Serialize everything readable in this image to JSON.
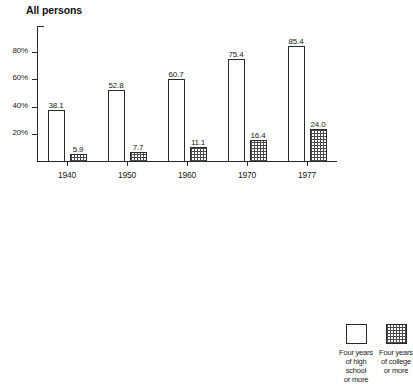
{
  "chart_data": [
    {
      "type": "bar",
      "title": "All persons",
      "xlabel": "",
      "ylabel": "",
      "ylim": [
        0,
        100
      ],
      "grid": false,
      "legend_position": "bottom-right",
      "categories": [
        "1940",
        "1950",
        "1960",
        "1970",
        "1977"
      ],
      "yticks": [
        "20%",
        "40%",
        "60%",
        "80%"
      ],
      "ytick_values": [
        20,
        40,
        60,
        80
      ],
      "series": [
        {
          "name": "Four years of high school or more",
          "style": "open",
          "values": [
            38.1,
            52.8,
            60.7,
            75.4,
            85.4
          ],
          "labels": [
            "38.1",
            "52.8",
            "60.7",
            "75.4",
            "85.4"
          ]
        },
        {
          "name": "Four years of college or more",
          "style": "hatched",
          "values": [
            5.9,
            7.7,
            11.1,
            16.4,
            24.0
          ],
          "labels": [
            "5.9",
            "7.7",
            "11.1",
            "16.4",
            "24.0"
          ]
        }
      ]
    },
    {
      "type": "bar",
      "title": "Black persons",
      "xlabel": "",
      "ylabel": "",
      "ylim": [
        0,
        100
      ],
      "grid": false,
      "legend_position": "bottom-right",
      "categories": [
        "1940",
        "1950",
        "1960",
        "1970",
        "1977"
      ],
      "yticks": [
        "20%",
        "40%",
        "60%",
        "80%"
      ],
      "ytick_values": [
        20,
        40,
        60,
        80
      ],
      "series": [
        {
          "name": "Four years of high school or more",
          "style": "open",
          "values": [
            11.6,
            22.2,
            37.7,
            56.2,
            74.4
          ],
          "labels": [
            "11.6",
            "22.2",
            "37.7",
            "56.2",
            "74.4"
          ]
        },
        {
          "name": "Four years of college or more",
          "style": "hatched",
          "values": [
            1.6,
            2.7,
            4.8,
            7.3,
            12.6
          ],
          "labels": [
            "1.6",
            "2.7",
            "4.8",
            "7.3",
            "12.6"
          ]
        }
      ]
    }
  ],
  "charts": {
    "all_persons": {
      "title": "All persons",
      "yticks": [
        "80%",
        "60%",
        "40%",
        "20%"
      ],
      "years": [
        "1940",
        "1950",
        "1960",
        "1970",
        "1977"
      ],
      "hs_labels": [
        "38.1",
        "52.8",
        "60.7",
        "75.4",
        "85.4"
      ],
      "col_labels": [
        "5.9",
        "7.7",
        "11.1",
        "16.4",
        "24.0"
      ]
    },
    "black_persons": {
      "title": "Black persons",
      "yticks": [
        "80%",
        "60%",
        "40%",
        "20%"
      ],
      "years": [
        "1940",
        "1950",
        "1960",
        "1970",
        "1977"
      ],
      "hs_labels": [
        "11.6",
        "22.2",
        "37.7",
        "56.2",
        "74.4"
      ],
      "col_labels": [
        "1.6",
        "2.7",
        "4.8",
        "7.3",
        "12.6"
      ]
    }
  },
  "legend": {
    "high_school": "Four years\nof high school\nor more",
    "college": "Four years\nof college\nor more"
  }
}
